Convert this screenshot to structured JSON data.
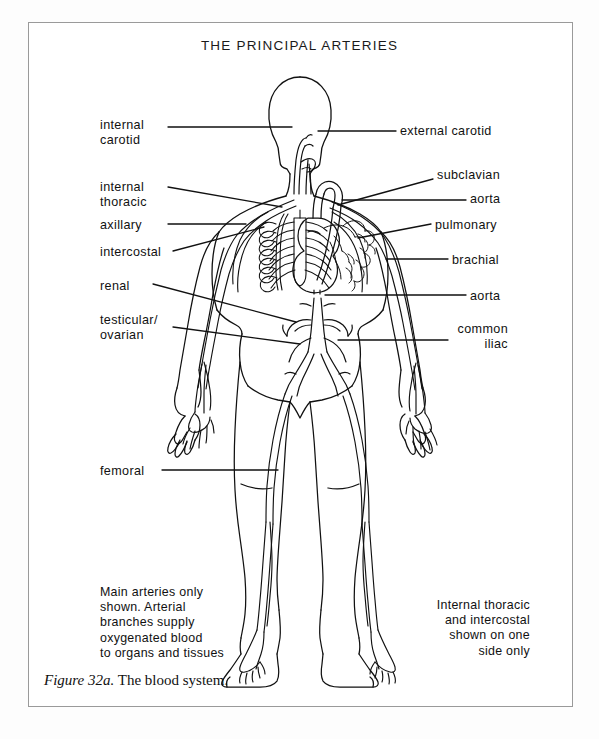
{
  "figure": {
    "title": "THE PRINCIPAL ARTERIES",
    "caption_number": "Figure 32a.",
    "caption_text": " The blood system."
  },
  "labels_left": [
    {
      "name": "internal-carotid",
      "text": "internal\ncarotid",
      "x": 100,
      "y": 118
    },
    {
      "name": "internal-thoracic",
      "text": "internal\nthoracic",
      "x": 100,
      "y": 180
    },
    {
      "name": "axillary",
      "text": "axillary",
      "x": 100,
      "y": 218
    },
    {
      "name": "intercostal",
      "text": "intercostal",
      "x": 100,
      "y": 245
    },
    {
      "name": "renal",
      "text": "renal",
      "x": 100,
      "y": 279
    },
    {
      "name": "testicular-ovarian",
      "text": "testicular/\novarian",
      "x": 100,
      "y": 313
    },
    {
      "name": "femoral",
      "text": "femoral",
      "x": 100,
      "y": 464
    }
  ],
  "labels_right": [
    {
      "name": "external-carotid",
      "text": "external carotid",
      "x": 400,
      "y": 124,
      "align": "left"
    },
    {
      "name": "subclavian",
      "text": "subclavian",
      "x": 437,
      "y": 168,
      "align": "left"
    },
    {
      "name": "aorta-arch",
      "text": "aorta",
      "x": 470,
      "y": 192,
      "align": "left"
    },
    {
      "name": "pulmonary",
      "text": "pulmonary",
      "x": 435,
      "y": 218,
      "align": "left"
    },
    {
      "name": "brachial",
      "text": "brachial",
      "x": 452,
      "y": 253,
      "align": "left"
    },
    {
      "name": "aorta-abdominal",
      "text": "aorta",
      "x": 470,
      "y": 289,
      "align": "left"
    },
    {
      "name": "common-iliac",
      "text": "common\niliac",
      "x": 398,
      "y": 322,
      "align": "right",
      "width": 110
    }
  ],
  "notes": [
    {
      "name": "note-main-arteries",
      "text": "Main arteries only\nshown. Arterial\nbranches supply\noxygenated blood\nto organs and tissues",
      "x": 100,
      "y": 585,
      "align": "left"
    },
    {
      "name": "note-one-side-only",
      "text": "Internal thoracic\nand intercostal\nshown on one\nside only",
      "x": 380,
      "y": 598,
      "align": "right",
      "width": 150
    }
  ],
  "colors": {
    "ink": "#111111",
    "page": "#ffffff",
    "border": "#9a9a9a"
  }
}
